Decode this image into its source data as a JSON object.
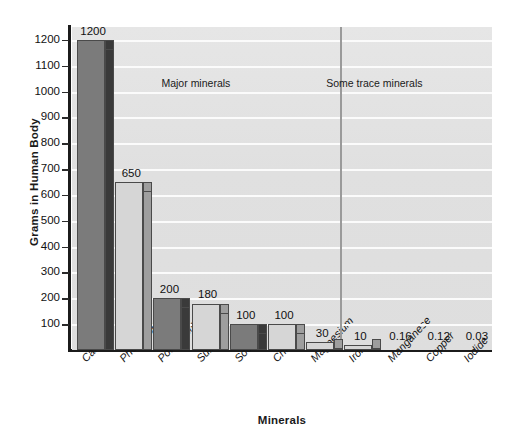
{
  "chart_data": {
    "type": "bar",
    "title": "",
    "xlabel": "Minerals",
    "ylabel": "Grams in Human Body",
    "categories": [
      "Calcium",
      "Phosphorus",
      "Potassium",
      "Sulfur",
      "Sodium",
      "Chloride",
      "Magnesium",
      "Iron",
      "Manganese",
      "Copper",
      "Iodide"
    ],
    "values": [
      1200,
      650,
      200,
      180,
      100,
      100,
      30,
      10,
      0.16,
      0.12,
      0.03
    ],
    "value_labels": [
      "1200",
      "650",
      "200",
      "180",
      "100",
      "100",
      "30",
      "10",
      "0.16",
      "0.12",
      "0.03"
    ],
    "ylim": [
      0,
      1250
    ],
    "yticks": [
      100,
      200,
      300,
      400,
      500,
      600,
      700,
      800,
      900,
      1000,
      1100,
      1200
    ],
    "ytick_labels": [
      "100",
      "200",
      "300",
      "400",
      "500",
      "600",
      "700",
      "800",
      "900",
      "1000",
      "1100",
      "1200"
    ],
    "grid": true,
    "legend": "none",
    "annotations": [
      {
        "text": "Major minerals",
        "x_fraction": 0.295
      },
      {
        "text": "Some trace minerals",
        "x_fraction": 0.72
      }
    ],
    "groups": [
      {
        "label": "Major minerals",
        "members": [
          "Calcium",
          "Phosphorus",
          "Potassium",
          "Sulfur",
          "Sodium",
          "Chloride",
          "Magnesium"
        ]
      },
      {
        "label": "Some trace minerals",
        "members": [
          "Iron",
          "Manganese",
          "Copper",
          "Iodide"
        ]
      }
    ],
    "bar_shades": [
      "dark",
      "light",
      "dark",
      "light",
      "dark",
      "light",
      "light",
      "light",
      "none",
      "none",
      "none"
    ],
    "colors": {
      "plot_background": "#e2e2e2",
      "gridline": "#fbfbfb",
      "axis": "#1b1b1b",
      "bar_dark_front": "#7b7b7b",
      "bar_dark_side": "#3a3a3a",
      "bar_light_front": "#d6d6d6",
      "bar_light_side": "#9e9e9e",
      "divider": "#9a9a9a",
      "text": "#1a1a1a"
    }
  }
}
